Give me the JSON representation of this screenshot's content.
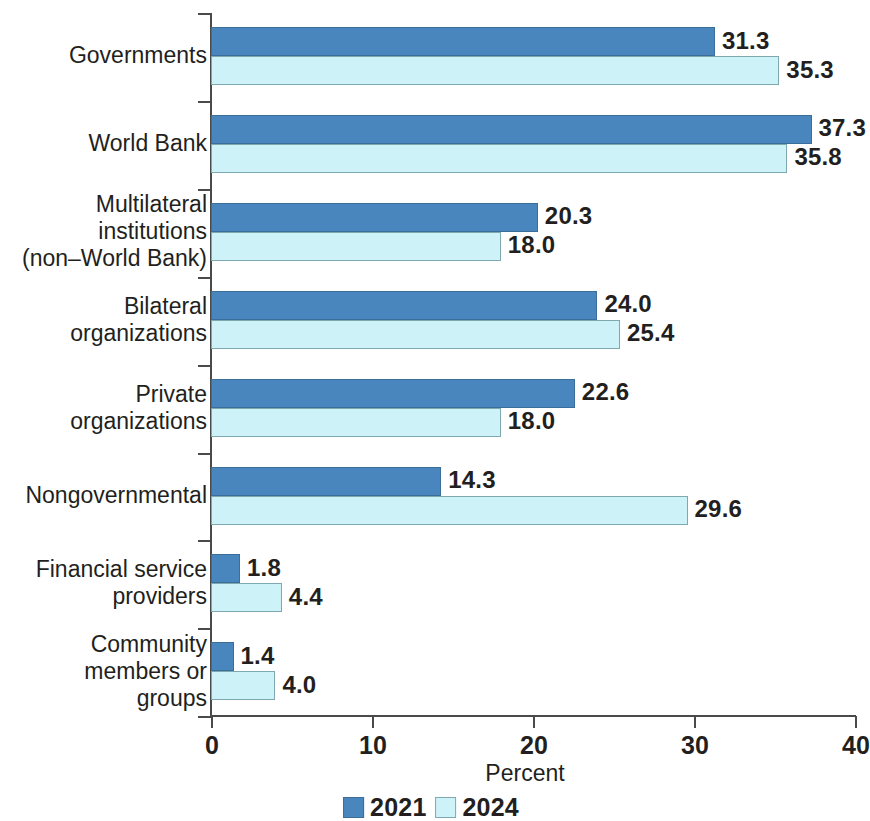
{
  "chart_data": {
    "type": "bar",
    "orientation": "horizontal",
    "title": "",
    "xlabel": "Percent",
    "ylabel": "",
    "xlim": [
      0,
      40
    ],
    "xticks": [
      0,
      10,
      20,
      30,
      40
    ],
    "xtick_labels": [
      "0",
      "10",
      "20",
      "30",
      "40"
    ],
    "grid": false,
    "legend_position": "bottom-center",
    "categories": [
      "Governments",
      "World Bank",
      "Multilateral\ninstitutions\n(non–World Bank)",
      "Bilateral\norganizations",
      "Private\norganizations",
      "Nongovernmental",
      "Financial service\nproviders",
      "Community\nmembers or\ngroups"
    ],
    "series": [
      {
        "name": "2021",
        "color": "#4a86be",
        "values": [
          31.3,
          37.3,
          20.3,
          24.0,
          22.6,
          14.3,
          1.8,
          1.4
        ],
        "value_labels": [
          "31.3",
          "37.3",
          "20.3",
          "24.0",
          "22.6",
          "14.3",
          "1.8",
          "1.4"
        ]
      },
      {
        "name": "2024",
        "color": "#cdf3f8",
        "values": [
          35.3,
          35.8,
          18.0,
          25.4,
          18.0,
          29.6,
          4.4,
          4.0
        ],
        "value_labels": [
          "35.3",
          "35.8",
          "18.0",
          "25.4",
          "18.0",
          "29.6",
          "4.4",
          "4.0"
        ]
      }
    ]
  },
  "legend": {
    "items": [
      {
        "label": "2021",
        "color": "#4a86be"
      },
      {
        "label": "2024",
        "color": "#cdf3f8"
      }
    ]
  },
  "axis": {
    "x_title": "Percent"
  }
}
